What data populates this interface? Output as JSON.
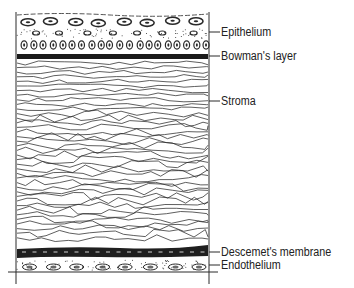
{
  "colors": {
    "ink": "#2a2a2a",
    "background": "#ffffff"
  },
  "layers": [
    {
      "name": "Epithelium",
      "label": "Epithelium"
    },
    {
      "name": "Bowman's layer",
      "label": "Bowman's layer"
    },
    {
      "name": "Stroma",
      "label": "Stroma"
    },
    {
      "name": "Descemet's membrane",
      "label": "Descemet's membrane"
    },
    {
      "name": "Endothelium",
      "label": "Endothelium"
    }
  ]
}
